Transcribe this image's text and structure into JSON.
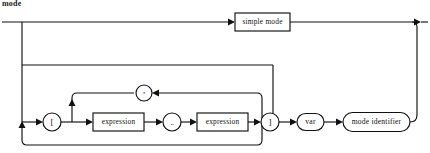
{
  "diagram": {
    "caption": "mode",
    "type": "railroad-syntax-diagram",
    "nodes": {
      "simple_mode": {
        "label": "simple mode",
        "shape": "rect"
      },
      "lbracket": {
        "label": "[",
        "shape": "circle"
      },
      "expression_1": {
        "label": "expression",
        "shape": "rect"
      },
      "dotdot": {
        "label": "..",
        "shape": "circle"
      },
      "expression_2": {
        "label": "expression",
        "shape": "rect"
      },
      "rbracket": {
        "label": "]",
        "shape": "circle"
      },
      "comma": {
        "label": ",",
        "shape": "circle"
      },
      "var": {
        "label": "var",
        "shape": "stadium"
      },
      "mode_identifier": {
        "label": "mode identifier",
        "shape": "stadium"
      }
    },
    "colors": {
      "line": "#111111",
      "background": "#ffffff",
      "text": "#111111"
    }
  }
}
